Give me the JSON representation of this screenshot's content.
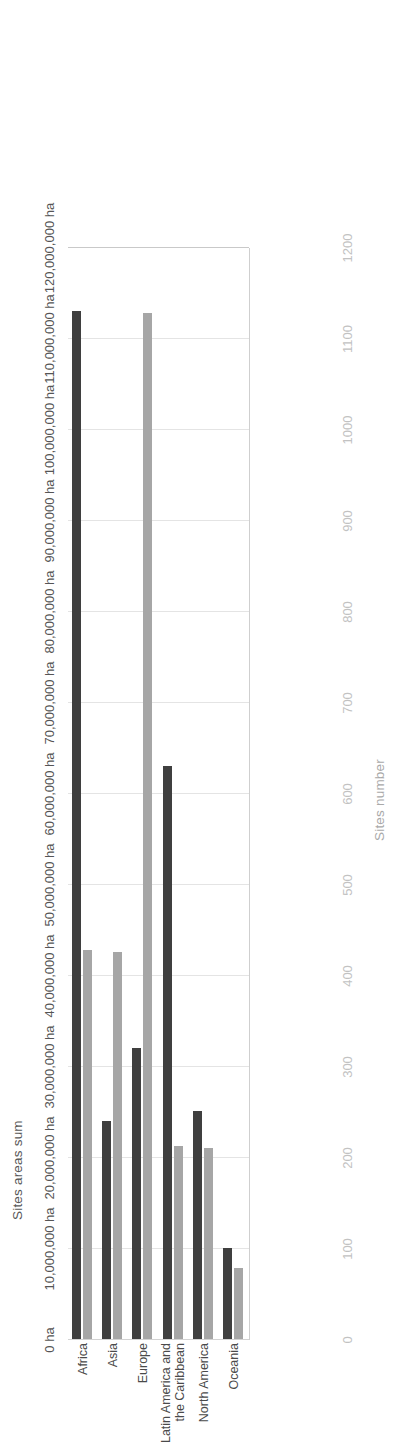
{
  "chart_data": {
    "type": "bar",
    "title": "",
    "orientation": "vertical-rotated",
    "categories": [
      "Africa",
      "Asia",
      "Europe",
      "Latin America and\nthe Caribbean",
      "North America",
      "Oceania"
    ],
    "series": [
      {
        "name": "Sites areas sum",
        "axis": "primary",
        "unit": "ha",
        "color": "#3f3f3f",
        "values": [
          113000000,
          24000000,
          32000000,
          63000000,
          25000000,
          10000000
        ]
      },
      {
        "name": "Sites number",
        "axis": "secondary",
        "unit": "sites",
        "color": "#a6a6a6",
        "values": [
          428,
          425,
          1127,
          212,
          210,
          78
        ]
      }
    ],
    "primary_axis": {
      "label": "Sites areas sum",
      "ticks": [
        "0 ha",
        "10,000,000 ha",
        "20,000,000 ha",
        "30,000,000 ha",
        "40,000,000 ha",
        "50,000,000 ha",
        "60,000,000 ha",
        "70,000,000 ha",
        "80,000,000 ha",
        "90,000,000 ha",
        "100,000,000 ha",
        "110,000,000 ha",
        "120,000,000 ha"
      ],
      "min": 0,
      "max": 120000000,
      "step": 10000000
    },
    "secondary_axis": {
      "label": "Sites number",
      "ticks": [
        "0",
        "100",
        "200",
        "300",
        "400",
        "500",
        "600",
        "700",
        "800",
        "900",
        "1000",
        "1100",
        "1200"
      ],
      "min": 0,
      "max": 1200,
      "step": 100
    },
    "grid": true,
    "legend": "none",
    "xlabel": "",
    "ylabel": "Sites areas sum"
  }
}
